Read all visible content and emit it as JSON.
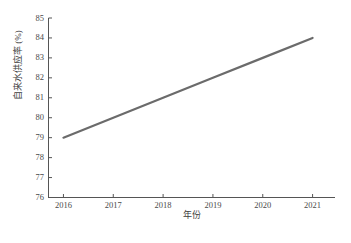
{
  "chart_data": {
    "type": "line",
    "title": "",
    "xlabel": "年份",
    "ylabel": "自来水供应率 (%)",
    "x": [
      2016,
      2017,
      2018,
      2019,
      2020,
      2021
    ],
    "categories": [
      "2016",
      "2017",
      "2018",
      "2019",
      "2020",
      "2021"
    ],
    "series": [
      {
        "name": "自来水供应率",
        "values": [
          79.0,
          80.0,
          81.0,
          82.0,
          83.0,
          84.0
        ],
        "color": "#6b6b6b"
      }
    ],
    "xlim": [
      2015.7,
      2021.45
    ],
    "ylim": [
      76,
      85
    ],
    "xticks": [
      "2016",
      "2017",
      "2018",
      "2019",
      "2020",
      "2021"
    ],
    "yticks": [
      "76",
      "77",
      "78",
      "79",
      "80",
      "81",
      "82",
      "83",
      "84",
      "85"
    ],
    "ytick_values": [
      76,
      77,
      78,
      79,
      80,
      81,
      82,
      83,
      84,
      85
    ],
    "grid": false,
    "legend": false,
    "legend_position": "none",
    "annotations": []
  },
  "figure": {
    "caption": "",
    "axis_color": "#555555",
    "line_color": "#6b6b6b",
    "background": "#ffffff"
  }
}
